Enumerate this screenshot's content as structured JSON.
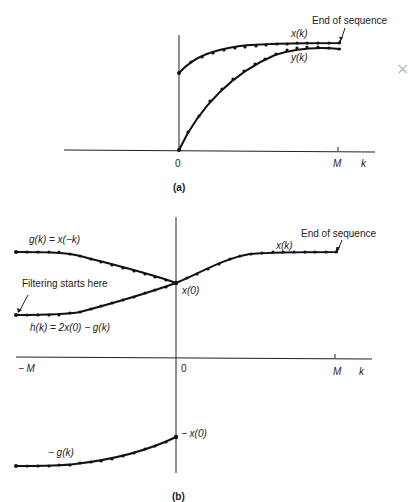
{
  "figure": {
    "panel_a": {
      "caption": "(a)",
      "annotation_end": "End of sequence",
      "labels": {
        "xk": "x(k)",
        "yk": "y(k)",
        "origin": "0",
        "M": "M",
        "k": "k"
      }
    },
    "panel_b": {
      "caption": "(b)",
      "annotation_end": "End of sequence",
      "annotation_start": "Filtering starts here",
      "labels": {
        "gk": "g(k) = x(−k)",
        "hk": "h(k) = 2x(0) − g(k)",
        "xk": "x(k)",
        "x0": "x(0)",
        "neg_x0": "− x(0)",
        "neg_gk": "− g(k)",
        "negM": "− M",
        "origin": "0",
        "M": "M",
        "k": "k"
      }
    }
  },
  "decor": {
    "margin_mark": "×"
  }
}
